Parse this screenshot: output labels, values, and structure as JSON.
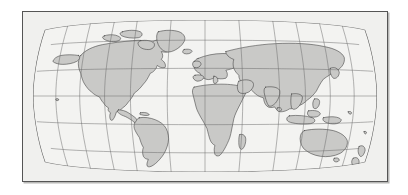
{
  "document": {
    "title": "World Map",
    "background_color": "#ffffff",
    "width": 408,
    "height": 195
  },
  "figure": {
    "name": "world-map-figure",
    "caption": "",
    "frame": {
      "border_color": "#555555",
      "shadow_color": "#b8b8b6",
      "x": 22,
      "y": 11,
      "width": 366,
      "height": 171
    }
  },
  "map": {
    "projection": "Robinson",
    "ocean_color": "#f0f0ee",
    "land_color": "#c9c9c7",
    "coastline_color": "#3a3a3a",
    "graticule_color": "#6b6b6b",
    "neatline_color": "#444444",
    "center_meridian_degrees": 0,
    "graticule": {
      "meridian_interval_degrees": 30,
      "parallel_interval_degrees": 30,
      "meridians": [
        -180,
        -150,
        -120,
        -90,
        -60,
        -30,
        0,
        30,
        60,
        90,
        120,
        150,
        180
      ],
      "parallels": [
        -60,
        -30,
        0,
        30,
        60
      ],
      "show_grid": true
    },
    "regions": [
      {
        "name": "north-america",
        "label": "North America"
      },
      {
        "name": "greenland",
        "label": "Greenland"
      },
      {
        "name": "south-america",
        "label": "South America"
      },
      {
        "name": "africa",
        "label": "Africa"
      },
      {
        "name": "europe",
        "label": "Europe"
      },
      {
        "name": "asia",
        "label": "Asia"
      },
      {
        "name": "australia",
        "label": "Australia"
      },
      {
        "name": "new-zealand",
        "label": "New Zealand"
      },
      {
        "name": "indonesia",
        "label": "Indonesia"
      },
      {
        "name": "japan",
        "label": "Japan"
      },
      {
        "name": "madagascar",
        "label": "Madagascar"
      },
      {
        "name": "british-isles",
        "label": "British Isles"
      },
      {
        "name": "iceland",
        "label": "Iceland"
      },
      {
        "name": "philippines",
        "label": "Philippines"
      }
    ]
  }
}
